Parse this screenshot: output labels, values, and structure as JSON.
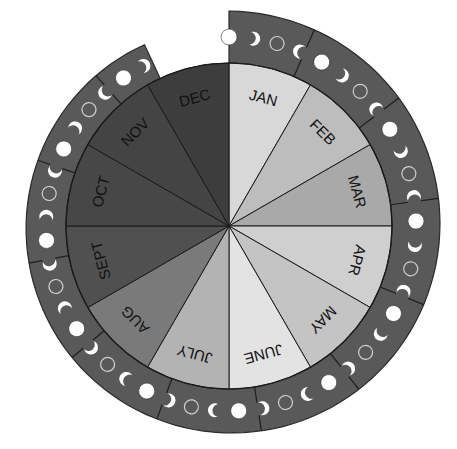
{
  "diagram": {
    "center": [
      229,
      226
    ],
    "pie_radius": 163,
    "ring": {
      "color": "#595959",
      "stroke": "#2a2a2a",
      "start_angle_deg": 0,
      "end_angle_deg": 335,
      "outer_radius_start": 215,
      "outer_radius_end": 200,
      "moon_radius_track": 187
    },
    "months": [
      {
        "label": "JAN",
        "color": "#d8d8d8"
      },
      {
        "label": "FEB",
        "color": "#bdbdbd"
      },
      {
        "label": "MAR",
        "color": "#a9a9a9"
      },
      {
        "label": "APR",
        "color": "#cfcfcf"
      },
      {
        "label": "MAY",
        "color": "#c4c4c4"
      },
      {
        "label": "JUNE",
        "color": "#e3e3e3"
      },
      {
        "label": "JULY",
        "color": "#b3b3b3"
      },
      {
        "label": "AUG",
        "color": "#7a7a7a"
      },
      {
        "label": "SEPT",
        "color": "#505050"
      },
      {
        "label": "OCT",
        "color": "#474747"
      },
      {
        "label": "NOV",
        "color": "#444444"
      },
      {
        "label": "DEC",
        "color": "#3d3d3d"
      }
    ],
    "moon_phase_cycle": [
      "full",
      "waning-crescent",
      "new",
      "waxing-crescent"
    ],
    "moon_colors": {
      "fill": "#ffffff",
      "new_outline": "#d0d0d0"
    }
  }
}
